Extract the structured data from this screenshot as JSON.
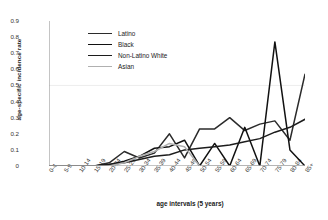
{
  "chart_data": {
    "type": "line",
    "title": "",
    "xlabel": "age intervals (5 years)",
    "ylabel": "age-specific incidence rate",
    "categories": [
      "0-4",
      "5-9",
      "10-14",
      "15-19",
      "20-24",
      "25-29",
      "30-34",
      "35-39",
      "40-44",
      "45-49",
      "50-54",
      "55-59",
      "60-64",
      "65-69",
      "70-74",
      "75-79",
      "80-84",
      "85+"
    ],
    "ylim": [
      0,
      0.9
    ],
    "yticks": [
      "0",
      "0.1",
      "0.2",
      "0.3",
      "0.4",
      "0.5",
      "0.6",
      "0.7",
      "0.8",
      "0.9"
    ],
    "grid": false,
    "legend_position": "upper-left-inside",
    "series": [
      {
        "name": "Latino",
        "color": "#2b2b2b",
        "values": [
          0,
          0,
          0,
          0,
          0.02,
          0.09,
          0.05,
          0.08,
          0.2,
          0.05,
          0.23,
          0.23,
          0.3,
          0.22,
          0.26,
          0.28,
          0.16,
          0.57
        ]
      },
      {
        "name": "Black",
        "color": "#111111",
        "values": [
          0,
          0,
          0,
          0,
          0.01,
          0.03,
          0.06,
          0.11,
          0.12,
          0.16,
          0,
          0.14,
          0,
          0.24,
          0,
          0.77,
          0.1,
          0
        ]
      },
      {
        "name": "Non-Latino White",
        "color": "#1c1c1c",
        "values": [
          0,
          0,
          0,
          0,
          0.01,
          0.02,
          0.04,
          0.06,
          0.07,
          0.1,
          0.11,
          0.12,
          0.13,
          0.15,
          0.17,
          0.21,
          0.24,
          0.29
        ]
      },
      {
        "name": "Asian",
        "color": "#b0b0b0",
        "values": [
          0,
          0,
          0,
          0,
          0,
          0.02,
          0.06,
          0.09,
          0.14,
          0.12,
          0,
          0,
          0,
          0,
          0,
          0,
          0,
          0
        ]
      }
    ]
  },
  "legend": {
    "items": [
      {
        "label": "Latino"
      },
      {
        "label": "Black"
      },
      {
        "label": "Non-Latino White"
      },
      {
        "label": "Asian"
      }
    ]
  }
}
